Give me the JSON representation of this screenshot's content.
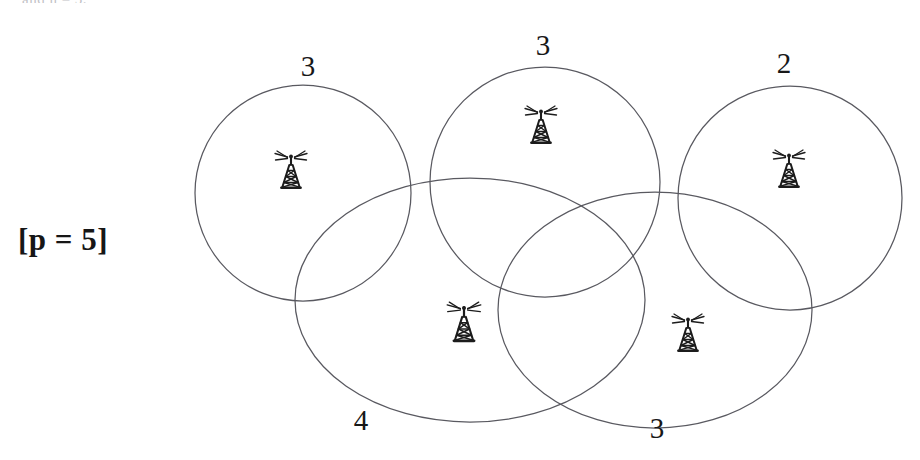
{
  "figure": {
    "clipped_header_text": "and  n  =  5.",
    "parameter_label": "[p = 5]",
    "background_color": "#ffffff",
    "stroke_color": "#595960",
    "tower_color": "#1c1c1c"
  },
  "cells": [
    {
      "id": "cell-top-left",
      "count_label": "3",
      "label_x": 308,
      "label_y": 66,
      "circle": {
        "cx": 303,
        "cy": 193,
        "r": 108
      },
      "tower": {
        "x": 291,
        "y": 187,
        "scale": 1.0
      }
    },
    {
      "id": "cell-top-middle",
      "count_label": "3",
      "label_x": 543,
      "label_y": 45,
      "circle": {
        "cx": 545,
        "cy": 182,
        "r": 115
      },
      "tower": {
        "x": 541,
        "y": 142,
        "scale": 1.0
      }
    },
    {
      "id": "cell-top-right",
      "count_label": "2",
      "label_x": 784,
      "label_y": 63,
      "circle": {
        "cx": 790,
        "cy": 198,
        "r": 112
      },
      "tower": {
        "x": 789,
        "y": 186,
        "scale": 1.0
      }
    },
    {
      "id": "cell-bottom-left",
      "count_label": "4",
      "label_x": 361,
      "label_y": 420,
      "circle": {
        "cx": 470,
        "cy": 300,
        "r": 175,
        "ry": 122
      },
      "tower": {
        "x": 464,
        "y": 340,
        "scale": 1.05
      }
    },
    {
      "id": "cell-bottom-right",
      "count_label": "3",
      "label_x": 657,
      "label_y": 428,
      "circle": {
        "cx": 655,
        "cy": 310,
        "r": 157,
        "ry": 118
      },
      "tower": {
        "x": 688,
        "y": 350,
        "scale": 1.0
      }
    }
  ],
  "legend": {
    "icon_name": "radio-tower-icon",
    "icon_meaning": "transmitter"
  }
}
